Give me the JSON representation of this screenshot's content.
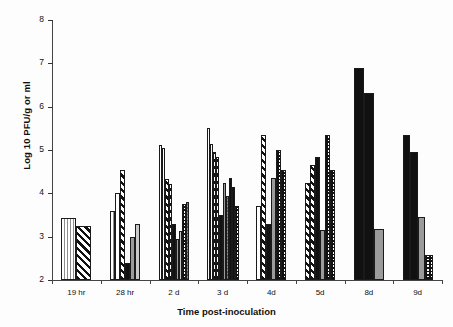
{
  "chart_data": {
    "type": "bar",
    "title": "",
    "xlabel": "Time post-inoculation",
    "ylabel": "Log 10 PFU/g or ml",
    "ylim": [
      2,
      8
    ],
    "yticks": [
      2,
      3,
      4,
      5,
      6,
      7,
      8
    ],
    "ytick_labels": [
      "2",
      "3",
      "4",
      "5",
      "6",
      "7",
      "8"
    ],
    "grid": false,
    "legend": "none",
    "categories": [
      "19 hr",
      "28 hr",
      "2 d",
      "3 d",
      "4d",
      "5d",
      "8d",
      "9d"
    ],
    "groups": [
      {
        "label": "19 hr",
        "bars": [
          {
            "value": 3.42,
            "fill": "vstripe"
          },
          {
            "value": 3.24,
            "fill": "hatch"
          }
        ]
      },
      {
        "label": "28 hr",
        "bars": [
          {
            "value": 3.6,
            "fill": "vstripe"
          },
          {
            "value": 4.0,
            "fill": "white"
          },
          {
            "value": 4.55,
            "fill": "hatch"
          },
          {
            "value": 2.4,
            "fill": "black"
          },
          {
            "value": 3.0,
            "fill": "gray"
          },
          {
            "value": 3.3,
            "fill": "lgray"
          }
        ]
      },
      {
        "label": "2 d",
        "bars": [
          {
            "value": 5.12,
            "fill": "white"
          },
          {
            "value": 5.05,
            "fill": "white"
          },
          {
            "value": 4.32,
            "fill": "hatch"
          },
          {
            "value": 4.22,
            "fill": "hatch"
          },
          {
            "value": 3.3,
            "fill": "black"
          },
          {
            "value": 2.95,
            "fill": "gray"
          },
          {
            "value": 3.12,
            "fill": "lgray"
          },
          {
            "value": 3.75,
            "fill": "check"
          },
          {
            "value": 3.8,
            "fill": "checkgray"
          }
        ]
      },
      {
        "label": "3 d",
        "bars": [
          {
            "value": 5.5,
            "fill": "white"
          },
          {
            "value": 5.15,
            "fill": "white"
          },
          {
            "value": 4.95,
            "fill": "hatch"
          },
          {
            "value": 4.85,
            "fill": "hatch"
          },
          {
            "value": 3.5,
            "fill": "black"
          },
          {
            "value": 4.25,
            "fill": "gray"
          },
          {
            "value": 3.95,
            "fill": "checkgray"
          },
          {
            "value": 4.35,
            "fill": "check"
          },
          {
            "value": 4.15,
            "fill": "check"
          },
          {
            "value": 3.7,
            "fill": "check"
          }
        ]
      },
      {
        "label": "4d",
        "bars": [
          {
            "value": 3.7,
            "fill": "white"
          },
          {
            "value": 5.35,
            "fill": "hatch"
          },
          {
            "value": 3.3,
            "fill": "black"
          },
          {
            "value": 4.35,
            "fill": "gray"
          },
          {
            "value": 5.0,
            "fill": "check"
          },
          {
            "value": 4.55,
            "fill": "check"
          }
        ]
      },
      {
        "label": "5d",
        "bars": [
          {
            "value": 4.25,
            "fill": "hatch"
          },
          {
            "value": 4.65,
            "fill": "hatch"
          },
          {
            "value": 4.85,
            "fill": "black"
          },
          {
            "value": 3.15,
            "fill": "gray"
          },
          {
            "value": 5.35,
            "fill": "check"
          },
          {
            "value": 4.55,
            "fill": "check"
          }
        ]
      },
      {
        "label": "8d",
        "bars": [
          {
            "value": 6.9,
            "fill": "black"
          },
          {
            "value": 6.32,
            "fill": "black"
          },
          {
            "value": 3.18,
            "fill": "gray"
          }
        ]
      },
      {
        "label": "9d",
        "bars": [
          {
            "value": 5.35,
            "fill": "black"
          },
          {
            "value": 4.95,
            "fill": "black"
          },
          {
            "value": 3.45,
            "fill": "gray"
          },
          {
            "value": 2.58,
            "fill": "check"
          }
        ]
      }
    ]
  },
  "axis": {
    "y_title": "Log 10 PFU/g or ml",
    "x_title": "Time post-inoculation"
  }
}
